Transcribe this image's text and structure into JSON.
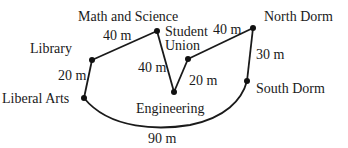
{
  "diagram": {
    "nodes": [
      {
        "id": "math",
        "label": "Math and Science",
        "x": 157,
        "y": 31,
        "lx": 78,
        "ly": 21,
        "anchor": "start"
      },
      {
        "id": "library",
        "label": "Library",
        "x": 92,
        "y": 60,
        "lx": 30,
        "ly": 53,
        "anchor": "start"
      },
      {
        "id": "liberal",
        "label": "Liberal Arts",
        "x": 84,
        "y": 98,
        "lx": 2,
        "ly": 103,
        "anchor": "start"
      },
      {
        "id": "engineering",
        "label": "Engineering",
        "x": 174,
        "y": 92,
        "lx": 136,
        "ly": 113,
        "anchor": "start"
      },
      {
        "id": "student_union_1",
        "label": "Student",
        "x": 188,
        "y": 59,
        "lx": 165,
        "ly": 36,
        "anchor": "start"
      },
      {
        "id": "north",
        "label": "North Dorm",
        "x": 253,
        "y": 28,
        "lx": 264,
        "ly": 21,
        "anchor": "start"
      },
      {
        "id": "south",
        "label": "South Dorm",
        "x": 247,
        "y": 81,
        "lx": 256,
        "ly": 93,
        "anchor": "start"
      }
    ],
    "student_union_line2": "Union",
    "edges": [
      {
        "from": "library",
        "to": "math",
        "label": "40 m",
        "lx": 104,
        "ly": 40
      },
      {
        "from": "library",
        "to": "liberal",
        "label": "20 m",
        "lx": 58,
        "ly": 80
      },
      {
        "from": "math",
        "to": "engineering",
        "label": "40 m",
        "lx": 138,
        "ly": 72
      },
      {
        "from": "engineering",
        "to": "student_union",
        "label": "20 m",
        "lx": 189,
        "ly": 84
      },
      {
        "from": "student_union",
        "to": "north",
        "label": "40 m",
        "lx": 213,
        "ly": 34
      },
      {
        "from": "north",
        "to": "south",
        "label": "30 m",
        "lx": 256,
        "ly": 59
      },
      {
        "from": "liberal",
        "to": "south",
        "label": "90 m",
        "lx": 148,
        "ly": 143
      }
    ]
  }
}
